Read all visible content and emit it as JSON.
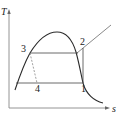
{
  "diagram": {
    "type": "T-s diagram (vapor-compression refrigeration cycle)",
    "axes": {
      "y_label": "T",
      "x_label": "s"
    },
    "points": [
      {
        "id": "1",
        "label": "1"
      },
      {
        "id": "2",
        "label": "2"
      },
      {
        "id": "3",
        "label": "3"
      },
      {
        "id": "4",
        "label": "4"
      }
    ],
    "processes": [
      {
        "from": "1",
        "to": "2",
        "style": "solid"
      },
      {
        "from": "2",
        "to": "3",
        "style": "solid"
      },
      {
        "from": "3",
        "to": "4",
        "style": "dashed"
      },
      {
        "from": "4",
        "to": "1",
        "style": "solid"
      }
    ],
    "colors": {
      "line": "#2a2a2a",
      "dashed": "#777777",
      "axis": "#888888"
    }
  }
}
